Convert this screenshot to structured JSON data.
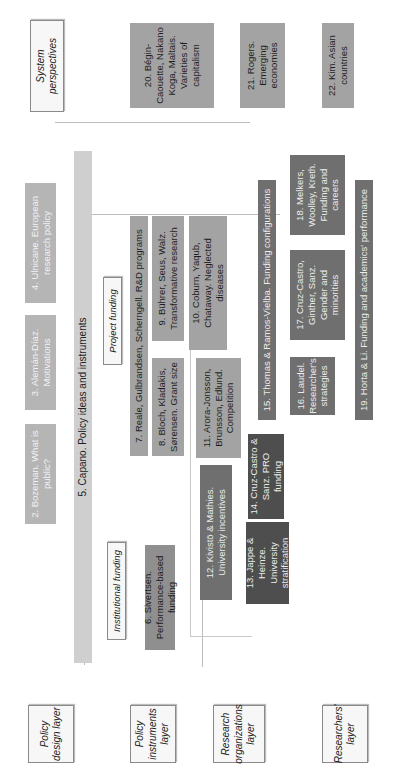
{
  "layers": {
    "policy_design": "Policy design layer",
    "policy_instruments": "Policy instruments layer",
    "research_organizations": "Research organizations layer",
    "researchers": "Researchers' layer",
    "system_perspectives": "System perspectives"
  },
  "subheaders": {
    "institutional_funding": "Institutional funding",
    "project_funding": "Project funding"
  },
  "chapters": {
    "c2": "2. Bozeman. What is public?",
    "c3": "3. Alemán-Díaz. Motivations",
    "c4": "4. Ulnicane. European research policy",
    "c5": "5. Capano. Policy ideas and instruments",
    "c6": "6. Sivertsen. Performance-based funding",
    "c7": "7. Reale, Gulbrandsen, Scherngell. R&D programs",
    "c8": "8. Bloch, Kladakis, Sørensen. Grant size",
    "c9": "9. Bührer, Seus, Walz. Transformative research",
    "c10": "10. Coburn, Yaqub, Chataway. Neglected diseases",
    "c11": "11. Arora-Jonsson, Brunsson, Edlund. Competition",
    "c12": "12. Kivistö & Mathies. University incentives",
    "c13": "13. Jappe & Heinze. University stratification",
    "c14": "14. Cruz-Castro & Sanz. PRO funding",
    "c15": "15. Thomas & Ramos-Vielba. Funding configurations",
    "c16": "16. Laudel. Researcher's strategies",
    "c17": "17. Cruz-Castro, Ginther, Sanz. Gender and minorities",
    "c18": "18. Melkers, Woolley, Kreth. Funding and careers",
    "c19": "19. Horta & Li. Funding and academics' performance",
    "c20": "20. Bégin-Caouette, Nakano Koga, Maltais. Varieties of capitalism",
    "c21": "21. Rogers. Emerging economies",
    "c22": "22. Kim. Asian countries"
  }
}
